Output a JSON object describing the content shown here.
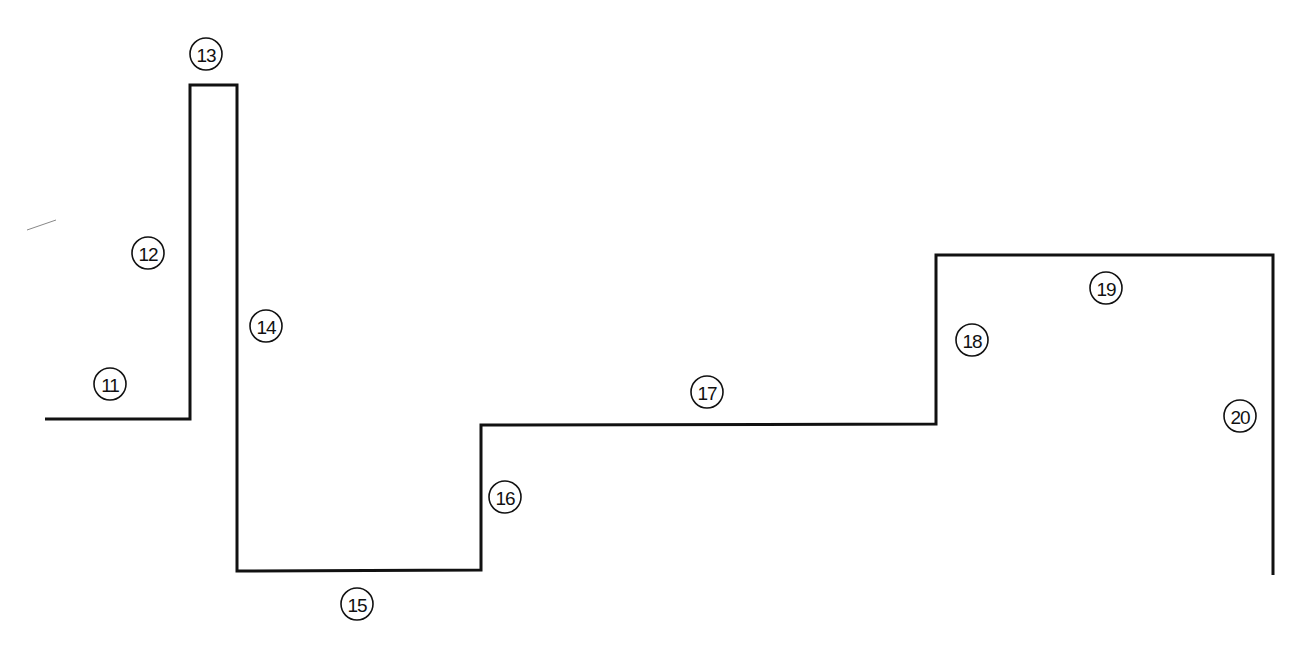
{
  "diagram": {
    "title": "",
    "line_color": "#111111",
    "background": "#ffffff",
    "profile_points": [
      [
        45,
        419
      ],
      [
        190,
        419
      ],
      [
        190,
        85
      ],
      [
        237,
        85
      ],
      [
        237,
        571
      ],
      [
        481,
        570
      ],
      [
        481,
        425
      ],
      [
        936,
        424
      ],
      [
        936,
        255
      ],
      [
        1273,
        255
      ],
      [
        1273,
        575
      ]
    ],
    "stray_mark": {
      "x1": 27,
      "y1": 230,
      "x2": 56,
      "y2": 220
    },
    "labels": [
      {
        "id": "11",
        "text": "11",
        "x": 110,
        "y": 384,
        "segment": "horizontal lower-left run"
      },
      {
        "id": "12",
        "text": "12",
        "x": 148,
        "y": 253,
        "segment": "rising vertical"
      },
      {
        "id": "13",
        "text": "13",
        "x": 206,
        "y": 54,
        "segment": "narrow top"
      },
      {
        "id": "14",
        "text": "14",
        "x": 266,
        "y": 326,
        "segment": "long descending vertical"
      },
      {
        "id": "15",
        "text": "15",
        "x": 357,
        "y": 604,
        "segment": "bottom run"
      },
      {
        "id": "16",
        "text": "16",
        "x": 505,
        "y": 497,
        "segment": "short rising vertical"
      },
      {
        "id": "17",
        "text": "17",
        "x": 707,
        "y": 392,
        "segment": "long middle run"
      },
      {
        "id": "18",
        "text": "18",
        "x": 972,
        "y": 340,
        "segment": "rising vertical"
      },
      {
        "id": "19",
        "text": "19",
        "x": 1106,
        "y": 288,
        "segment": "upper right run"
      },
      {
        "id": "20",
        "text": "20",
        "x": 1240,
        "y": 416,
        "segment": "descending right vertical"
      }
    ]
  }
}
